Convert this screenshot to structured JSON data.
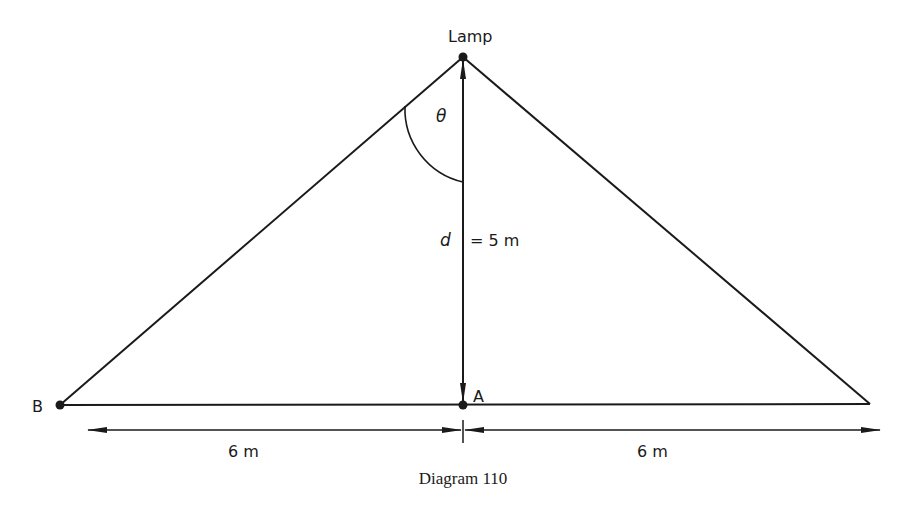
{
  "diagram": {
    "caption": "Diagram 110",
    "points": {
      "lamp": {
        "label": "Lamp"
      },
      "a": {
        "label": "A"
      },
      "b": {
        "label": "B"
      }
    },
    "angle_label": "θ",
    "height": {
      "symbol": "d",
      "value": "= 5 m"
    },
    "dimensions": {
      "left": "6 m",
      "right": "6 m"
    },
    "colors": {
      "line": "#1a1a1a",
      "background": "#ffffff"
    }
  }
}
